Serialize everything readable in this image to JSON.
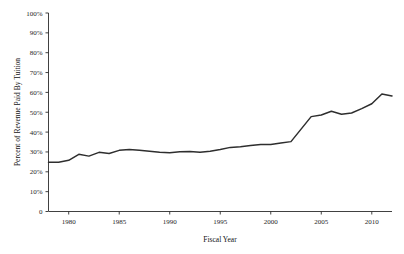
{
  "chart_data": {
    "type": "line",
    "title": "",
    "subtitle": "",
    "xlabel": "Fiscal Year",
    "ylabel": "Percent of Revenue Paid By Tuition",
    "xlim": [
      1978,
      2012
    ],
    "ylim": [
      0,
      100
    ],
    "grid": false,
    "legend": "none",
    "y_unit": "%",
    "x_ticks": [
      1980,
      1985,
      1990,
      1995,
      2000,
      2005,
      2010
    ],
    "x_tick_labels": [
      "1980",
      "1985",
      "1990",
      "1995",
      "2000",
      "2005",
      "2010"
    ],
    "y_ticks": [
      0,
      10,
      20,
      30,
      40,
      50,
      60,
      70,
      80,
      90,
      100
    ],
    "y_tick_labels": [
      "0",
      "10%",
      "20%",
      "30%",
      "40%",
      "50%",
      "60%",
      "70%",
      "80%",
      "90%",
      "100%"
    ],
    "series": [
      {
        "name": "Percent of Revenue Paid By Tuition",
        "color": "#2e2e2e",
        "x": [
          1978,
          1979,
          1980,
          1981,
          1982,
          1983,
          1984,
          1985,
          1986,
          1987,
          1988,
          1989,
          1990,
          1991,
          1992,
          1993,
          1994,
          1995,
          1996,
          1997,
          1998,
          1999,
          2000,
          2001,
          2002,
          2003,
          2004,
          2005,
          2006,
          2007,
          2008,
          2009,
          2010,
          2011,
          2012
        ],
        "values": [
          24.8,
          24.8,
          25.8,
          28.8,
          27.9,
          29.8,
          29.2,
          30.8,
          31.2,
          30.9,
          30.4,
          29.8,
          29.6,
          30.1,
          30.2,
          29.8,
          30.4,
          31.2,
          32.3,
          32.6,
          33.2,
          33.7,
          33.7,
          34.5,
          35.2,
          41.5,
          47.8,
          48.6,
          50.5,
          49.0,
          49.6,
          51.8,
          54.3,
          59.2,
          58.2
        ]
      }
    ],
    "annotations": []
  },
  "axes": {
    "y_axis_title": "Percent of Revenue Paid By Tuition",
    "x_axis_title": "Fiscal Year"
  },
  "colors": {
    "line": "#2e2e2e",
    "axis": "#2b2b2b",
    "text": "#1a1a1a",
    "background": "#ffffff"
  }
}
